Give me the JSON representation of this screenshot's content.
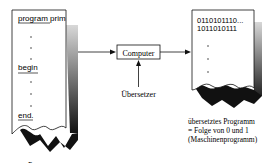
{
  "source_program": {
    "lines": [
      "program prim",
      "begin",
      "end."
    ],
    "caption": "Programm"
  },
  "computer_box": {
    "label": "Computer"
  },
  "translator": {
    "label": "Übersetzer"
  },
  "machine_program": {
    "lines": [
      "0110101110...",
      "1011010111"
    ],
    "caption": [
      "übersetztes Programm",
      "= Folge von 0 und 1",
      "(Maschinenprogramm)"
    ]
  },
  "colors": {
    "ink": "#111111",
    "shadow": "#222222"
  }
}
